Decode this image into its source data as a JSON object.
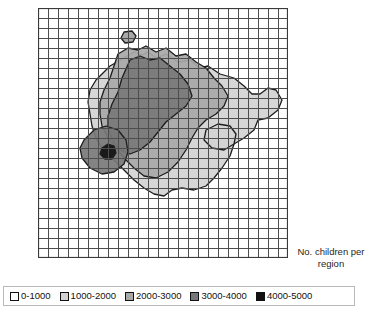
{
  "figure": {
    "caption": "No. children per region",
    "caption_line1": "No. children per",
    "caption_line2": "region"
  },
  "grid": {
    "columns": 25,
    "rows": 25,
    "line_color": "#4d4d4d",
    "background_color": "#ffffff"
  },
  "legend": {
    "items": [
      {
        "label": "0-1000",
        "color": "#ffffff"
      },
      {
        "label": "1000-2000",
        "color": "#d2d2d2"
      },
      {
        "label": "2000-3000",
        "color": "#a8a8a8"
      },
      {
        "label": "3000-4000",
        "color": "#787878"
      },
      {
        "label": "4000-5000",
        "color": "#111111"
      }
    ]
  },
  "chart_data": {
    "type": "heatmap",
    "title": "No. children per region",
    "subtitle": "",
    "xlabel": "",
    "ylabel": "",
    "grid": true,
    "legend_position": "bottom",
    "value_unit": "children",
    "classes": [
      {
        "range": "0-1000",
        "min": 0,
        "max": 1000,
        "color": "#ffffff"
      },
      {
        "range": "1000-2000",
        "min": 1000,
        "max": 2000,
        "color": "#d2d2d2"
      },
      {
        "range": "2000-3000",
        "min": 2000,
        "max": 3000,
        "color": "#a8a8a8"
      },
      {
        "range": "3000-4000",
        "min": 3000,
        "max": 4000,
        "color": "#787878"
      },
      {
        "range": "4000-5000",
        "min": 4000,
        "max": 5000,
        "color": "#111111"
      }
    ],
    "grid_extent": {
      "x0": 0,
      "y0": 0,
      "x1": 250,
      "y1": 250,
      "cols": 25,
      "rows": 25
    },
    "peak": {
      "x": 69,
      "y": 144,
      "class": "4000-5000"
    },
    "contours": [
      {
        "class": "1000-2000",
        "color": "#d2d2d2",
        "paths": [
          "M 72 58 L 86 50 L 96 44 L 104 47 L 110 44 L 118 50 L 128 46 L 140 54 L 152 52 L 162 60 L 170 58 L 182 66 L 196 70 L 206 78 L 214 86 L 222 86 L 230 80 L 238 82 L 244 92 L 240 102 L 230 110 L 220 112 L 216 122 L 206 130 L 196 136 L 192 148 L 184 160 L 176 170 L 168 178 L 156 182 L 144 180 L 134 182 L 126 188 L 116 186 L 106 180 L 96 172 L 88 164 L 80 156 L 72 148 L 64 140 L 58 130 L 54 118 L 52 106 L 50 94 L 52 82 L 58 72 L 66 64 Z",
          "M 168 122 L 180 116 L 192 118 L 198 126 L 196 136 L 186 142 L 174 140 L 166 132 Z"
        ]
      },
      {
        "class": "2000-3000",
        "color": "#a8a8a8",
        "paths": [
          "M 80 46 L 90 40 L 100 42 L 108 38 L 118 44 L 128 40 L 138 48 L 148 46 L 158 54 L 168 60 L 176 70 L 184 78 L 190 88 L 186 98 L 178 106 L 168 112 L 160 120 L 154 130 L 148 142 L 140 154 L 130 164 L 118 170 L 106 168 L 96 160 L 86 150 L 78 140 L 70 130 L 64 118 L 62 106 L 62 94 L 66 82 L 72 70 L 76 58 Z"
        ]
      },
      {
        "class": "3000-4000",
        "color": "#787878",
        "paths": [
          "M 92 52 L 102 48 L 112 52 L 122 50 L 132 58 L 142 66 L 150 76 L 154 88 L 148 98 L 138 106 L 128 114 L 120 124 L 112 134 L 102 142 L 92 146 L 82 142 L 74 132 L 70 120 L 70 108 L 74 96 L 80 84 L 84 70 Z",
          "M 46 132 L 56 122 L 68 118 L 80 122 L 88 132 L 90 144 L 86 156 L 76 164 L 64 166 L 52 160 L 44 150 L 42 140 Z"
        ]
      },
      {
        "class": "4000-5000",
        "color": "#111111",
        "paths": [
          "M 64 140 L 70 136 L 76 138 L 78 145 L 74 151 L 67 151 L 62 146 Z"
        ]
      }
    ],
    "outlier_patch": {
      "x": 90,
      "y": 29,
      "class": "2000-3000",
      "note": "small isolated region near top"
    }
  }
}
